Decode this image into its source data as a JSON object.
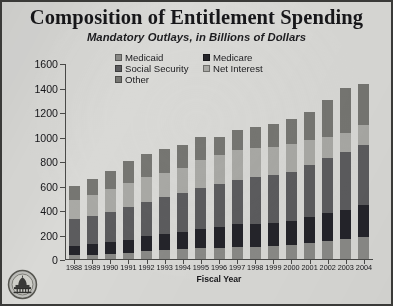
{
  "title": "Composition of Entitlement Spending",
  "subtitle": "Mandatory Outlays, in Billions of Dollars",
  "xtitle": "Fiscal Year",
  "logo_name": "capitol-dome-seal",
  "legend": {
    "items": [
      {
        "label": "Medicaid",
        "color": "#8a8a87"
      },
      {
        "label": "Medicare",
        "color": "#24242a"
      },
      {
        "label": "Social Security",
        "color": "#5c5c5e"
      },
      {
        "label": "Net Interest",
        "color": "#a9a9a5"
      },
      {
        "label": "Other",
        "color": "#767672"
      }
    ]
  },
  "chart_data": {
    "type": "bar",
    "stacked": true,
    "title": "Composition of Entitlement Spending",
    "subtitle": "Mandatory Outlays, in Billions of Dollars",
    "xlabel": "Fiscal Year",
    "ylabel": "",
    "ylim": [
      0,
      1600
    ],
    "yticks": [
      0,
      200,
      400,
      600,
      800,
      1000,
      1200,
      1400,
      1600
    ],
    "grid": false,
    "legend_position": "top-center",
    "categories": [
      "1988",
      "1989",
      "1990",
      "1991",
      "1992",
      "1993",
      "1994",
      "1995",
      "1996",
      "1997",
      "1998",
      "1999",
      "2000",
      "2001",
      "2002",
      "2003",
      "2004"
    ],
    "series": [
      {
        "name": "Medicaid",
        "color": "#8a8a87",
        "values": [
          31,
          35,
          41,
          53,
          68,
          76,
          82,
          89,
          92,
          96,
          101,
          108,
          118,
          129,
          148,
          161,
          176
        ]
      },
      {
        "name": "Medicare",
        "color": "#24242a",
        "values": [
          79,
          85,
          98,
          104,
          116,
          127,
          140,
          157,
          171,
          186,
          189,
          187,
          194,
          212,
          225,
          243,
          265
        ]
      },
      {
        "name": "Social Security",
        "color": "#5c5c5e",
        "values": [
          217,
          231,
          246,
          266,
          285,
          301,
          316,
          332,
          347,
          362,
          376,
          387,
          402,
          427,
          451,
          468,
          490
        ]
      },
      {
        "name": "Net Interest",
        "color": "#a9a9a5",
        "values": [
          152,
          169,
          184,
          194,
          199,
          198,
          203,
          232,
          241,
          244,
          241,
          230,
          223,
          206,
          171,
          153,
          160
        ]
      },
      {
        "name": "Other",
        "color": "#767672",
        "values": [
          121,
          130,
          151,
          183,
          192,
          198,
          189,
          190,
          149,
          162,
          173,
          188,
          203,
          226,
          305,
          375,
          339
        ]
      }
    ]
  }
}
